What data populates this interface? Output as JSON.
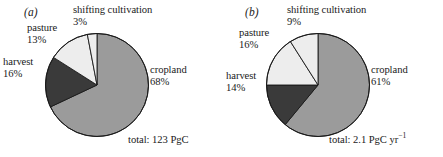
{
  "figure": {
    "background": "#ffffff",
    "panels": [
      {
        "id": "a",
        "panel_label": "(a)",
        "total_text": "total: 123 PgC",
        "labels": {
          "shifting_name": "shifting cultivation",
          "shifting_value": "3%",
          "pasture_name": "pasture",
          "pasture_value": "13%",
          "harvest_name": "harvest",
          "harvest_value": "16%",
          "cropland_name": "cropland",
          "cropland_value": "68%"
        }
      },
      {
        "id": "b",
        "panel_label": "(b)",
        "total_text_main": "total: 2.1 PgC yr",
        "total_text_sup": "−1",
        "labels": {
          "shifting_name": "shifting cultivation",
          "shifting_value": "9%",
          "pasture_name": "pasture",
          "pasture_value": "16%",
          "harvest_name": "harvest",
          "harvest_value": "14%",
          "cropland_name": "cropland",
          "cropland_value": "61%"
        }
      }
    ]
  },
  "colors": {
    "cropland": "#9b9b9b",
    "harvest": "#3a3a3a",
    "pasture": "#ededed",
    "shifting": "#ededed",
    "outline": "#1a1a1a",
    "text": "#1a1a1a"
  },
  "chart_data": [
    {
      "type": "pie",
      "title": "(a)",
      "labels": [
        "cropland",
        "harvest",
        "pasture",
        "shifting cultivation"
      ],
      "values": [
        68,
        16,
        13,
        3
      ],
      "value_labels": [
        "68%",
        "16%",
        "13%",
        "3%"
      ],
      "units": "percent",
      "annotation": "total: 123 PgC",
      "total": 123,
      "total_units": "PgC",
      "colors": [
        "#9b9b9b",
        "#3a3a3a",
        "#ededed",
        "#ededed"
      ],
      "start_angle_deg": 0,
      "direction": "clockwise",
      "legend": "none (direct labels)",
      "grid": false
    },
    {
      "type": "pie",
      "title": "(b)",
      "labels": [
        "cropland",
        "harvest",
        "pasture",
        "shifting cultivation"
      ],
      "values": [
        61,
        14,
        16,
        9
      ],
      "value_labels": [
        "61%",
        "14%",
        "16%",
        "9%"
      ],
      "units": "percent",
      "annotation": "total: 2.1 PgC yr−1",
      "total": 2.1,
      "total_units": "PgC yr^-1",
      "colors": [
        "#9b9b9b",
        "#3a3a3a",
        "#ededed",
        "#ededed"
      ],
      "start_angle_deg": 0,
      "direction": "clockwise",
      "legend": "none (direct labels)",
      "grid": false
    }
  ]
}
